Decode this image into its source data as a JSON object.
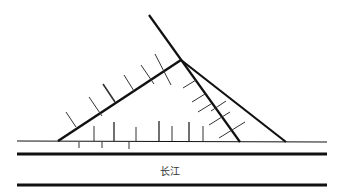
{
  "diagram": {
    "type": "geomorphology-sketch",
    "river_label": "长江",
    "colors": {
      "stroke": "#111111",
      "hatch": "#333333",
      "background": "#ffffff",
      "text": "#333333"
    },
    "elements": {
      "triangle": {
        "left_base": [
          58,
          141
        ],
        "apex": [
          181,
          60
        ],
        "right_base": [
          286,
          142
        ]
      },
      "long_diagonal": {
        "from": [
          149,
          15
        ],
        "to": [
          240,
          142
        ]
      },
      "river_bank_thin": {
        "y": 141,
        "x1": 17,
        "x2": 327
      },
      "river_bank_thick_top": {
        "y": 154,
        "x1": 17,
        "x2": 327
      },
      "river_bank_thick_bottom": {
        "y": 185,
        "x1": 17,
        "x2": 327
      }
    }
  }
}
